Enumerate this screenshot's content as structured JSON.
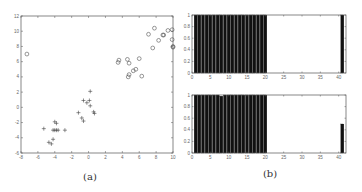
{
  "captions": {
    "a": "(a)",
    "b": "(b)"
  },
  "chart_data": [
    {
      "id": "a",
      "type": "scatter",
      "title": "",
      "xlabel": "",
      "ylabel": "",
      "xlim": [
        -8,
        10
      ],
      "ylim": [
        -6,
        12
      ],
      "xticks": [
        -8,
        -6,
        -4,
        -2,
        0,
        2,
        4,
        6,
        8,
        10
      ],
      "yticks": [
        -6,
        -4,
        -2,
        0,
        2,
        4,
        6,
        8,
        10,
        12
      ],
      "grid": false,
      "series": [
        {
          "name": "circles",
          "marker": "o",
          "points": [
            [
              -7.3,
              7.0
            ],
            [
              3.5,
              5.9
            ],
            [
              3.6,
              6.2
            ],
            [
              4.6,
              6.3
            ],
            [
              4.8,
              5.8
            ],
            [
              6.0,
              6.4
            ],
            [
              4.7,
              4.0
            ],
            [
              4.8,
              4.3
            ],
            [
              5.3,
              4.8
            ],
            [
              5.6,
              5.0
            ],
            [
              6.3,
              4.1
            ],
            [
              7.1,
              9.6
            ],
            [
              7.6,
              7.8
            ],
            [
              7.8,
              10.4
            ],
            [
              8.3,
              8.8
            ],
            [
              8.8,
              9.5
            ],
            [
              8.9,
              9.5
            ],
            [
              9.4,
              10.1
            ],
            [
              9.9,
              10.2
            ],
            [
              9.9,
              8.9
            ],
            [
              10.0,
              8.0
            ],
            [
              10.0,
              7.9
            ]
          ]
        },
        {
          "name": "crosses",
          "marker": "+",
          "points": [
            [
              -5.3,
              -2.8
            ],
            [
              -4.0,
              -1.9
            ],
            [
              -3.8,
              -2.1
            ],
            [
              -4.2,
              -3.0
            ],
            [
              -4.0,
              -3.0
            ],
            [
              -3.8,
              -3.0
            ],
            [
              -3.6,
              -3.0
            ],
            [
              -2.8,
              -3.0
            ],
            [
              -4.7,
              -4.6
            ],
            [
              -4.4,
              -4.8
            ],
            [
              -4.2,
              -4.2
            ],
            [
              0.2,
              2.1
            ],
            [
              -0.6,
              0.9
            ],
            [
              -0.2,
              0.6
            ],
            [
              0.1,
              0.9
            ],
            [
              0.2,
              0.2
            ],
            [
              0.6,
              -0.6
            ],
            [
              0.7,
              -0.8
            ],
            [
              -1.2,
              -0.7
            ],
            [
              -0.8,
              -1.4
            ],
            [
              -0.6,
              -1.8
            ]
          ]
        }
      ]
    },
    {
      "id": "b-top",
      "type": "bar",
      "title": "",
      "xlabel": "",
      "ylabel": "",
      "xlim": [
        0,
        42
      ],
      "ylim": [
        0,
        1
      ],
      "xticks": [
        0,
        5,
        10,
        15,
        20,
        25,
        30,
        35,
        40
      ],
      "yticks": [
        0,
        0.2,
        0.4,
        0.6,
        0.8,
        1
      ],
      "categories": [
        1,
        2,
        3,
        4,
        5,
        6,
        7,
        8,
        9,
        10,
        11,
        12,
        13,
        14,
        15,
        16,
        17,
        18,
        19,
        20,
        41
      ],
      "values": [
        1,
        1,
        1,
        1,
        1,
        1,
        1,
        1,
        1,
        1,
        1,
        1,
        1,
        1,
        1,
        1,
        1,
        1,
        1,
        1,
        1
      ]
    },
    {
      "id": "b-bottom",
      "type": "bar",
      "title": "",
      "xlabel": "",
      "ylabel": "",
      "xlim": [
        0,
        42
      ],
      "ylim": [
        0,
        1
      ],
      "xticks": [
        0,
        5,
        10,
        15,
        20,
        25,
        30,
        35,
        40
      ],
      "yticks": [
        0,
        0.2,
        0.4,
        0.6,
        0.8,
        1
      ],
      "categories": [
        1,
        2,
        3,
        4,
        5,
        6,
        7,
        8,
        9,
        10,
        11,
        12,
        13,
        14,
        15,
        16,
        17,
        18,
        19,
        20,
        41
      ],
      "values": [
        1,
        1,
        1,
        1,
        1,
        1,
        1,
        0.98,
        1,
        1,
        1,
        1,
        1,
        1,
        1,
        1,
        1,
        1,
        1,
        1,
        0.5
      ]
    }
  ]
}
